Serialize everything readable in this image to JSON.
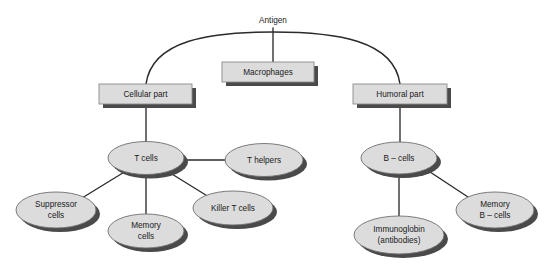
{
  "diagram": {
    "background_color": "#ffffff",
    "node_fill_color": "#dcdcdc",
    "node_stroke_color": "#6e6e6e",
    "shadow_color": "#4a4a4a",
    "connector_color": "#2b2b2b",
    "root": {
      "label": "Antigen",
      "x": 273,
      "y": 21
    },
    "boxes": [
      {
        "id": "macrophages",
        "label": "Macrophages",
        "x": 222,
        "y": 62,
        "w": 92,
        "h": 20
      },
      {
        "id": "cellular-part",
        "label": "Cellular part",
        "x": 99,
        "y": 84,
        "w": 93,
        "h": 20
      },
      {
        "id": "humoral-part",
        "label": "Humoral part",
        "x": 353,
        "y": 84,
        "w": 94,
        "h": 20
      }
    ],
    "ellipses": [
      {
        "id": "t-cells",
        "lines": [
          "T cells"
        ],
        "cx": 146,
        "cy": 158,
        "rx": 38,
        "ry": 16.5
      },
      {
        "id": "t-helpers",
        "lines": [
          "T helpers"
        ],
        "cx": 264,
        "cy": 160,
        "rx": 39,
        "ry": 16.5
      },
      {
        "id": "b-cells",
        "lines": [
          "B – cells"
        ],
        "cx": 399,
        "cy": 158,
        "rx": 38,
        "ry": 16
      },
      {
        "id": "suppressor-cells",
        "lines": [
          "Suppressor",
          "cells"
        ],
        "cx": 56,
        "cy": 210,
        "rx": 40,
        "ry": 18
      },
      {
        "id": "memory-cells",
        "lines": [
          "Memory",
          "cells"
        ],
        "cx": 146,
        "cy": 231,
        "rx": 38,
        "ry": 17
      },
      {
        "id": "killer-t-cells",
        "lines": [
          "Killer T cells"
        ],
        "cx": 233,
        "cy": 208,
        "rx": 40,
        "ry": 17
      },
      {
        "id": "immunoglobin",
        "lines": [
          "Immunoglobin",
          "(antibodies)"
        ],
        "cx": 399,
        "cy": 235,
        "rx": 45,
        "ry": 19
      },
      {
        "id": "memory-b-cells",
        "lines": [
          "Memory",
          "B – cells"
        ],
        "cx": 495,
        "cy": 210,
        "rx": 39,
        "ry": 18
      }
    ],
    "edges": [
      {
        "id": "antigen-to-macrophages",
        "from": "Antigen",
        "to": "Macrophages"
      },
      {
        "id": "antigen-to-cellular-part",
        "from": "Antigen",
        "to": "Cellular part"
      },
      {
        "id": "antigen-to-humoral-part",
        "from": "Antigen",
        "to": "Humoral part"
      },
      {
        "id": "cellular-part-to-t-cells",
        "from": "Cellular part",
        "to": "T cells"
      },
      {
        "id": "humoral-part-to-b-cells",
        "from": "Humoral part",
        "to": "B – cells"
      },
      {
        "id": "t-cells-to-t-helpers",
        "from": "T cells",
        "to": "T helpers"
      },
      {
        "id": "t-cells-to-suppressor-cells",
        "from": "T cells",
        "to": "Suppressor cells"
      },
      {
        "id": "t-cells-to-memory-cells",
        "from": "T cells",
        "to": "Memory cells"
      },
      {
        "id": "t-cells-to-killer-t-cells",
        "from": "T cells",
        "to": "Killer T cells"
      },
      {
        "id": "b-cells-to-immunoglobin",
        "from": "B – cells",
        "to": "Immunoglobin (antibodies)"
      },
      {
        "id": "b-cells-to-memory-b-cells",
        "from": "B – cells",
        "to": "Memory B – cells"
      }
    ]
  }
}
